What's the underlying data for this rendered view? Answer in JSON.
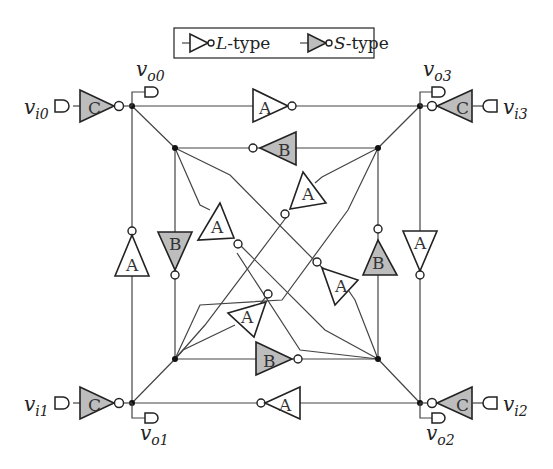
{
  "legend": {
    "l_type_label": "L-type",
    "l_type_letter": "L",
    "l_type_suffix": "-type",
    "s_type_label": "S-type",
    "s_type_letter": "S",
    "s_type_suffix": "-type"
  },
  "colors": {
    "s_type_fill": "#bdbdbd",
    "l_type_fill": "#ffffff",
    "line": "#444444"
  },
  "ports": {
    "vi0": {
      "base": "v",
      "sub": "i0"
    },
    "vi1": {
      "base": "v",
      "sub": "i1"
    },
    "vi2": {
      "base": "v",
      "sub": "i2"
    },
    "vi3": {
      "base": "v",
      "sub": "i3"
    },
    "vo0": {
      "base": "v",
      "sub": "o0"
    },
    "vo1": {
      "base": "v",
      "sub": "o1"
    },
    "vo2": {
      "base": "v",
      "sub": "o2"
    },
    "vo3": {
      "base": "v",
      "sub": "o3"
    }
  },
  "inverters": {
    "c0": "C",
    "c1": "C",
    "c2": "C",
    "c3": "C",
    "a_top": "A",
    "a_bottom": "A",
    "a_left": "A",
    "a_right": "A",
    "b_top": "B",
    "b_bottom": "B",
    "b_left": "B",
    "b_right": "B",
    "a_diag_ul": "A",
    "a_diag_ur": "A",
    "a_diag_ll": "A",
    "a_diag_lr": "A"
  }
}
